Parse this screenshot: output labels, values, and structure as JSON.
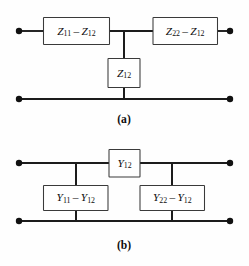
{
  "figure": {
    "background_color": "#fefefe",
    "line_color": "#1c1c1c",
    "box_stroke_color": "#3a3a3a",
    "box_fill_color": "#ffffff",
    "text_color": "#0d0d0d"
  },
  "panels": [
    {
      "id": "a",
      "caption": "(a)",
      "network_type": "T-network (impedance / Z-parameter equivalent)",
      "components": [
        {
          "id": "z11-z12",
          "label_main": "Z",
          "label_sub": "11",
          "operator": "–",
          "label_main2": "Z",
          "label_sub2": "12",
          "full_text": "Z11 – Z12",
          "position": "series-left"
        },
        {
          "id": "z22-z12",
          "label_main": "Z",
          "label_sub": "22",
          "operator": "–",
          "label_main2": "Z",
          "label_sub2": "12",
          "full_text": "Z22 – Z12",
          "position": "series-right"
        },
        {
          "id": "z12",
          "label_main": "Z",
          "label_sub": "12",
          "operator": "",
          "label_main2": "",
          "label_sub2": "",
          "full_text": "Z12",
          "position": "shunt-center"
        }
      ],
      "terminals": [
        {
          "id": "port1-top",
          "x": 19,
          "y": 31
        },
        {
          "id": "port2-top",
          "x": 230,
          "y": 31
        },
        {
          "id": "port1-bottom",
          "x": 19,
          "y": 99
        },
        {
          "id": "port2-bottom",
          "x": 230,
          "y": 99
        }
      ]
    },
    {
      "id": "b",
      "caption": "(b)",
      "network_type": "Pi-network (admittance / Y-parameter equivalent)",
      "components": [
        {
          "id": "y12",
          "label_main": "Y",
          "label_sub": "12",
          "operator": "",
          "label_main2": "",
          "label_sub2": "",
          "full_text": "Y12",
          "position": "series-center"
        },
        {
          "id": "y11-y12",
          "label_main": "Y",
          "label_sub": "11",
          "operator": "–",
          "label_main2": "Y",
          "label_sub2": "12",
          "full_text": "Y11 – Y12",
          "position": "shunt-left"
        },
        {
          "id": "y22-y12",
          "label_main": "Y",
          "label_sub": "22",
          "operator": "–",
          "label_main2": "Y",
          "label_sub2": "12",
          "full_text": "Y22 – Y12",
          "position": "shunt-right"
        }
      ],
      "terminals": [
        {
          "id": "port1-top",
          "x": 19,
          "y": 163
        },
        {
          "id": "port2-top",
          "x": 230,
          "y": 163
        },
        {
          "id": "port1-bottom",
          "x": 19,
          "y": 221
        },
        {
          "id": "port2-bottom",
          "x": 230,
          "y": 221
        }
      ]
    }
  ]
}
